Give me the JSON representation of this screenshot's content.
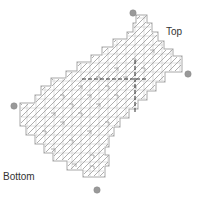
{
  "diagram": {
    "labels": {
      "top": "Top",
      "bottom": "Bottom"
    },
    "colors": {
      "outline": "#a8a8a8",
      "inner_outline": "#cfcfcf",
      "hatch": "#9a9a9a",
      "grid": "#c4c4c4",
      "dashed": "#333333",
      "marker": "#999999",
      "text": "#333333"
    },
    "markers": [
      {
        "name": "top-left-marker",
        "cx": 133,
        "cy": 13
      },
      {
        "name": "right-marker",
        "cx": 188,
        "cy": 74
      },
      {
        "name": "left-marker",
        "cx": 14,
        "cy": 106
      },
      {
        "name": "bottom-marker",
        "cx": 97,
        "cy": 190
      }
    ],
    "cell_size": 9
  }
}
